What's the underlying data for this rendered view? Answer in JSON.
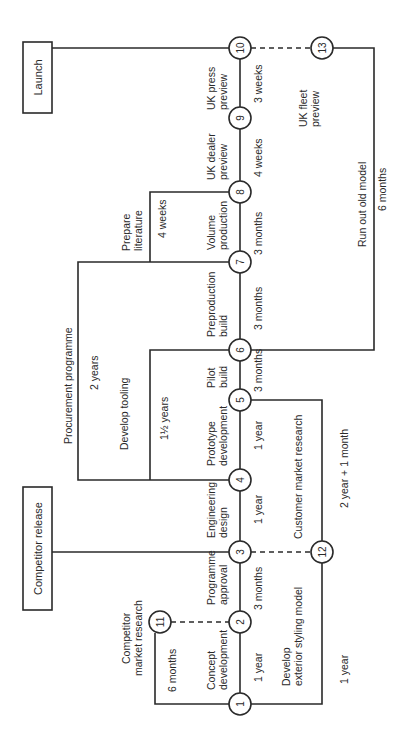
{
  "diagram": {
    "boxes": {
      "launch": "Launch",
      "competitor_release": "Competitor release"
    },
    "nodes": {
      "n1": "1",
      "n2": "2",
      "n3": "3",
      "n4": "4",
      "n5": "5",
      "n6": "6",
      "n7": "7",
      "n8": "8",
      "n9": "9",
      "n10": "10",
      "n11": "11",
      "n12": "12",
      "n13": "13"
    },
    "activities": {
      "concept_1": "Concept",
      "concept_2": "development",
      "concept_dur": "1 year",
      "approval_1": "Programme",
      "approval_2": "approval",
      "approval_dur": "3 months",
      "eng_1": "Engineering",
      "eng_2": "design",
      "eng_dur": "1 year",
      "proto_1": "Prototype",
      "proto_2": "development",
      "proto_dur": "1 year",
      "pilot_1": "Pilot",
      "pilot_2": "build",
      "pilot_dur": "3 months",
      "preprod_1": "Preproduction",
      "preprod_2": "build",
      "preprod_dur": "3 months",
      "volume_1": "Volume",
      "volume_2": "production",
      "volume_dur": "3 months",
      "dealer_1": "UK dealer",
      "dealer_2": "preview",
      "dealer_dur": "4 weeks",
      "press_1": "UK press",
      "press_2": "preview",
      "press_dur": "3 weeks",
      "fleet_1": "UK fleet",
      "fleet_2": "preview",
      "comp_research_1": "Competitor",
      "comp_research_2": "market research",
      "comp_research_dur": "6 months",
      "styling_1": "Develop",
      "styling_2": "exterior styling model",
      "styling_dur": "1 year",
      "cust_research": "Customer market research",
      "cust_research_dur": "2 year + 1 month",
      "procurement": "Procurement programme",
      "procurement_dur": "2 years",
      "tooling": "Develop tooling",
      "tooling_dur": "1½ years",
      "literature_1": "Prepare",
      "literature_2": "literature",
      "literature_dur": "4 weeks",
      "runout": "Run out old model",
      "runout_dur": "6 months"
    }
  }
}
